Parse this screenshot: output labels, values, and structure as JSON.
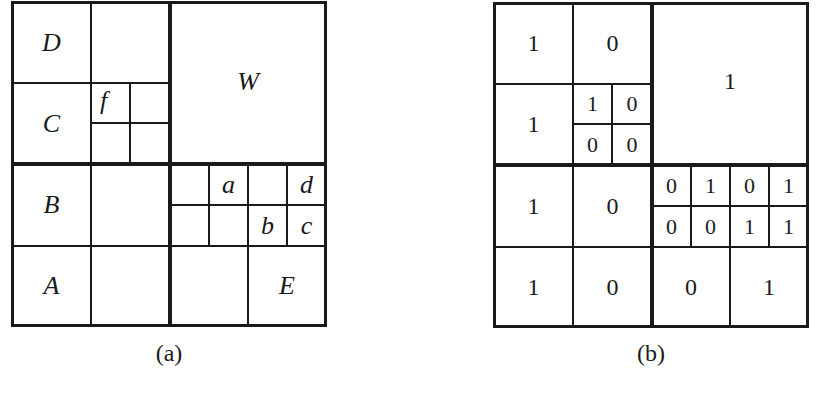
{
  "figure_a": {
    "caption": "(a)",
    "labels": {
      "D": "D",
      "C": "C",
      "B": "B",
      "A": "A",
      "W": "W",
      "E": "E",
      "f": "f",
      "a": "a",
      "b": "b",
      "c": "c",
      "d": "d"
    }
  },
  "figure_b": {
    "caption": "(b)",
    "values": {
      "nw_nw": "1",
      "nw_ne": "0",
      "nw_sw": "1",
      "nw_se_nw": "1",
      "nw_se_ne": "0",
      "nw_se_sw": "0",
      "nw_se_se": "0",
      "ne": "1",
      "sw_nw": "1",
      "sw_ne": "0",
      "sw_sw": "1",
      "sw_se": "0",
      "se_top_r1c1": "0",
      "se_top_r1c2": "1",
      "se_top_r1c3": "0",
      "se_top_r1c4": "1",
      "se_top_r2c1": "0",
      "se_top_r2c2": "0",
      "se_top_r2c3": "1",
      "se_top_r2c4": "1",
      "se_sw": "0",
      "se_se": "1"
    }
  }
}
